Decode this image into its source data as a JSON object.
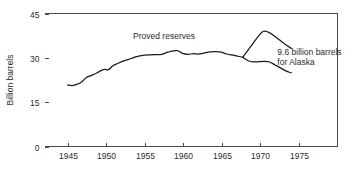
{
  "chart_data": {
    "type": "line",
    "title": "",
    "xlabel": "",
    "ylabel": "Billion barrels",
    "xlim": [
      1942,
      1980
    ],
    "ylim": [
      0,
      45
    ],
    "grid": false,
    "legend_position": "none",
    "x_ticks": [
      1945,
      1950,
      1955,
      1960,
      1965,
      1970,
      1975
    ],
    "x_tick_labels": [
      "1945",
      "1950",
      "1955",
      "1960",
      "1965",
      "1970",
      "1975"
    ],
    "y_ticks": [
      0,
      15,
      30,
      45
    ],
    "y_tick_labels": [
      "0",
      "15",
      "30",
      "45"
    ],
    "annotations": [
      {
        "name": "proved-reserves-label",
        "text": "Proved reserves",
        "x": 1957.5,
        "y": 36.5
      },
      {
        "name": "alaska-label-line1",
        "text": "9.6 billion barrels",
        "x": 1972.2,
        "y": 31.0
      },
      {
        "name": "alaska-label-line2",
        "text": "for Alaska",
        "x": 1972.2,
        "y": 27.5
      }
    ],
    "series": [
      {
        "name": "Proved reserves",
        "points": [
          [
            1945.0,
            20.8
          ],
          [
            1945.6,
            20.6
          ],
          [
            1946.2,
            21.0
          ],
          [
            1946.8,
            21.8
          ],
          [
            1947.4,
            23.3
          ],
          [
            1948.0,
            24.0
          ],
          [
            1948.6,
            24.6
          ],
          [
            1949.2,
            25.5
          ],
          [
            1949.8,
            26.1
          ],
          [
            1950.3,
            26.0
          ],
          [
            1950.9,
            27.4
          ],
          [
            1951.5,
            28.1
          ],
          [
            1952.1,
            28.8
          ],
          [
            1952.8,
            29.4
          ],
          [
            1953.5,
            30.0
          ],
          [
            1954.2,
            30.6
          ],
          [
            1955.0,
            30.9
          ],
          [
            1955.8,
            31.0
          ],
          [
            1956.5,
            31.1
          ],
          [
            1957.2,
            31.2
          ],
          [
            1958.0,
            31.9
          ],
          [
            1958.6,
            32.3
          ],
          [
            1959.3,
            32.4
          ],
          [
            1959.9,
            31.5
          ],
          [
            1960.6,
            31.2
          ],
          [
            1961.3,
            31.4
          ],
          [
            1962.0,
            31.3
          ],
          [
            1962.8,
            31.7
          ],
          [
            1963.5,
            32.0
          ],
          [
            1964.2,
            32.1
          ],
          [
            1964.9,
            31.9
          ],
          [
            1965.6,
            31.3
          ],
          [
            1966.3,
            31.0
          ],
          [
            1967.0,
            30.6
          ],
          [
            1967.7,
            30.2
          ]
        ]
      },
      {
        "name": "Proved reserves including Alaska",
        "points": [
          [
            1967.7,
            30.2
          ],
          [
            1968.4,
            32.6
          ],
          [
            1969.1,
            35.1
          ],
          [
            1969.8,
            37.5
          ],
          [
            1970.4,
            39.0
          ],
          [
            1971.1,
            38.6
          ],
          [
            1971.8,
            37.4
          ],
          [
            1972.5,
            36.0
          ],
          [
            1973.2,
            34.6
          ],
          [
            1974.0,
            33.2
          ]
        ]
      },
      {
        "name": "Proved reserves excluding Alaska",
        "points": [
          [
            1967.7,
            30.2
          ],
          [
            1968.4,
            29.0
          ],
          [
            1969.1,
            28.6
          ],
          [
            1969.8,
            28.7
          ],
          [
            1970.5,
            28.8
          ],
          [
            1971.2,
            28.6
          ],
          [
            1971.9,
            27.6
          ],
          [
            1972.6,
            26.6
          ],
          [
            1973.3,
            25.6
          ],
          [
            1974.0,
            24.9
          ]
        ]
      }
    ]
  }
}
